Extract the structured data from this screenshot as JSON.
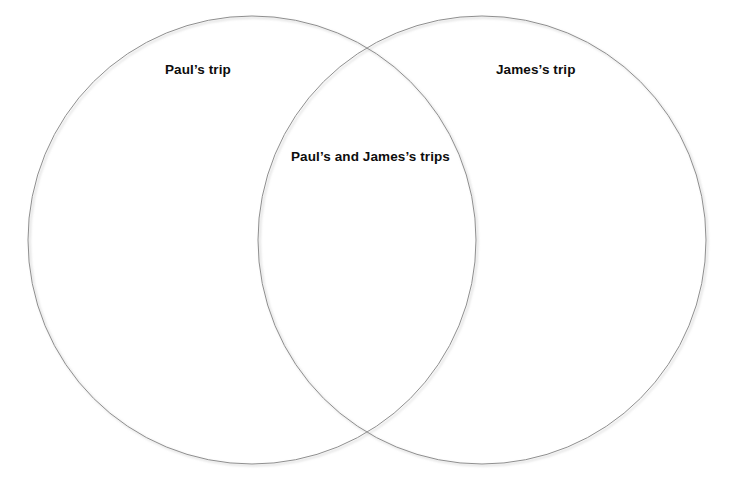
{
  "figure": {
    "type": "venn-diagram",
    "width": 731,
    "height": 484,
    "background_color": "#ffffff",
    "stroke_color": "#8f8f8f",
    "stroke_width": 1,
    "shadow_color": "#cfcfcf",
    "text_color": "#0d0d0d",
    "top_clipped_text": ""
  },
  "sets": [
    {
      "id": "left",
      "label": "Paul’s trip",
      "center_x": 252,
      "center_y": 240,
      "radius": 224
    },
    {
      "id": "right",
      "label": "James’s trip",
      "center_x": 482,
      "center_y": 240,
      "radius": 224
    }
  ],
  "intersection": {
    "id": "both",
    "label": "Paul’s and James’s trips",
    "center_x": 373,
    "center_y": 157
  }
}
